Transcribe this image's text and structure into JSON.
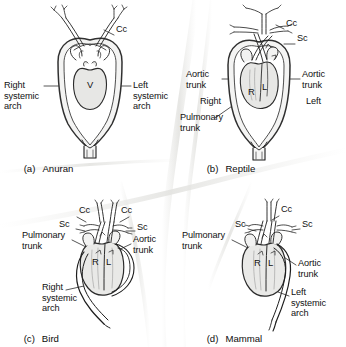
{
  "figure": {
    "background_color": "#ffffff",
    "ink_color": "#1a1a1a",
    "vessel_fill": "#f2f2f2",
    "heart_fill": "#ececeb"
  },
  "panels": [
    {
      "id": "a",
      "tag": "(a)",
      "name": "Anuran",
      "chambers": [
        {
          "code": "V",
          "x": 92,
          "y": 84
        }
      ],
      "labels": [
        {
          "text": "Cc",
          "x": 116,
          "y": 29,
          "align": "left"
        },
        {
          "text": "Right\nsystemic\narch",
          "x": 4,
          "y": 84,
          "align": "left"
        },
        {
          "text": "Left\nsystemic\narch",
          "x": 133,
          "y": 84,
          "align": "left"
        }
      ],
      "caption_x": 13,
      "caption_y": 156
    },
    {
      "id": "b",
      "tag": "(b)",
      "name": "Reptile",
      "chambers": [
        {
          "code": "R",
          "x": 251,
          "y": 92
        },
        {
          "code": "L",
          "x": 265,
          "y": 88
        }
      ],
      "labels": [
        {
          "text": "Cc",
          "x": 286,
          "y": 23,
          "align": "left"
        },
        {
          "text": "Sc",
          "x": 297,
          "y": 38,
          "align": "left"
        },
        {
          "text": "Aortic\ntrunk",
          "x": 186,
          "y": 74,
          "align": "left"
        },
        {
          "text": "Aortic\ntrunk",
          "x": 302,
          "y": 74,
          "align": "left"
        },
        {
          "text": "Right",
          "x": 200,
          "y": 101,
          "align": "left"
        },
        {
          "text": "Left",
          "x": 306,
          "y": 101,
          "align": "left"
        },
        {
          "text": "Pulmonary\ntrunk",
          "x": 180,
          "y": 117,
          "align": "left"
        }
      ],
      "caption_x": 196,
      "caption_y": 156
    },
    {
      "id": "c",
      "tag": "(c)",
      "name": "Bird",
      "chambers": [
        {
          "code": "R",
          "x": 96,
          "y": 262
        },
        {
          "code": "L",
          "x": 110,
          "y": 262
        }
      ],
      "labels": [
        {
          "text": "Cc",
          "x": 79,
          "y": 210,
          "align": "left"
        },
        {
          "text": "Cc",
          "x": 121,
          "y": 210,
          "align": "left"
        },
        {
          "text": "Sc",
          "x": 61,
          "y": 223,
          "align": "left"
        },
        {
          "text": "Sc",
          "x": 137,
          "y": 226,
          "align": "left"
        },
        {
          "text": "Pulmonary\ntrunk",
          "x": 24,
          "y": 234,
          "align": "left"
        },
        {
          "text": "Aortic\ntrunk",
          "x": 133,
          "y": 238,
          "align": "left"
        },
        {
          "text": "Right\nsystemic\narch",
          "x": 42,
          "y": 286,
          "align": "left"
        }
      ],
      "caption_x": 13,
      "caption_y": 326
    },
    {
      "id": "d",
      "tag": "(d)",
      "name": "Mammal",
      "chambers": [
        {
          "code": "R",
          "x": 258,
          "y": 263
        },
        {
          "code": "L",
          "x": 272,
          "y": 263
        }
      ],
      "labels": [
        {
          "text": "Cc",
          "x": 281,
          "y": 209,
          "align": "left"
        },
        {
          "text": "Sc",
          "x": 237,
          "y": 223,
          "align": "left"
        },
        {
          "text": "Sc",
          "x": 302,
          "y": 223,
          "align": "left"
        },
        {
          "text": "Pulmonary\ntrunk",
          "x": 184,
          "y": 234,
          "align": "left"
        },
        {
          "text": "Aortic\ntrunk",
          "x": 298,
          "y": 262,
          "align": "left"
        },
        {
          "text": "Left\nsystemic\narch",
          "x": 291,
          "y": 291,
          "align": "left"
        }
      ],
      "caption_x": 196,
      "caption_y": 326
    }
  ],
  "legend_codes": {
    "Cc": "common carotid",
    "Sc": "subclavian",
    "V": "ventricle",
    "R": "right ventricle",
    "L": "left ventricle"
  }
}
